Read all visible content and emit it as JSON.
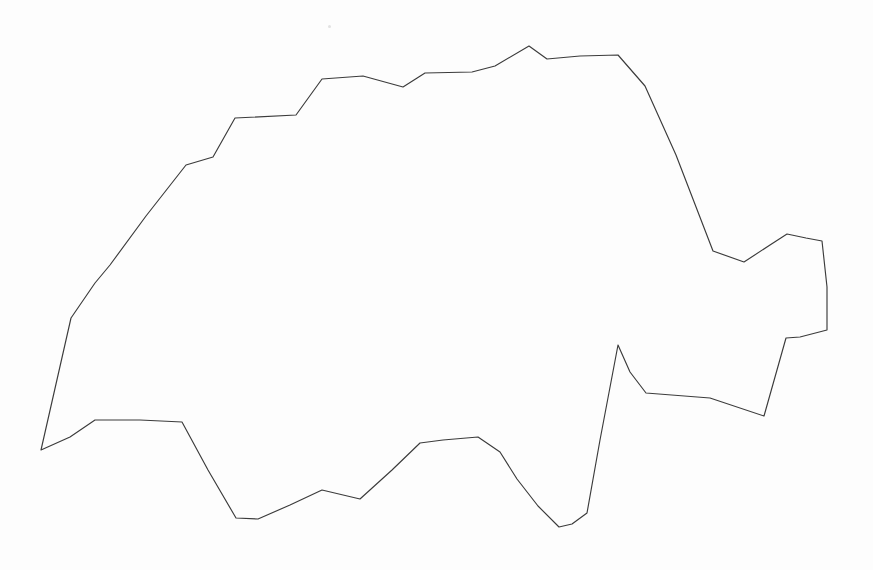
{
  "canvas": {
    "width": 873,
    "height": 570,
    "background_color": "#fdfdfd",
    "title": "Switzerland national border outline"
  },
  "map": {
    "subject": "Switzerland",
    "projection_note": "unprojected polygon outline, no labels",
    "outline_label": "country-border-outline",
    "stroke_color": "#3b3b3b",
    "stroke_width": 1.15,
    "fill_color": "none",
    "closed": true,
    "labels": [],
    "legend": [],
    "scale_bar": null,
    "north_arrow": null,
    "vertices": [
      [
        41,
        450
      ],
      [
        71,
        318
      ],
      [
        95,
        283
      ],
      [
        110,
        265
      ],
      [
        146,
        216
      ],
      [
        186,
        165
      ],
      [
        213,
        157
      ],
      [
        235,
        118
      ],
      [
        296,
        115
      ],
      [
        322,
        79
      ],
      [
        363,
        76
      ],
      [
        403,
        87
      ],
      [
        425,
        73
      ],
      [
        472,
        72
      ],
      [
        495,
        66
      ],
      [
        529,
        46
      ],
      [
        547,
        59
      ],
      [
        580,
        56
      ],
      [
        618,
        55
      ],
      [
        645,
        86
      ],
      [
        676,
        155
      ],
      [
        713,
        251
      ],
      [
        744,
        262
      ],
      [
        770,
        245
      ],
      [
        787,
        234
      ],
      [
        806,
        238
      ],
      [
        822,
        241
      ],
      [
        827,
        287
      ],
      [
        827,
        330
      ],
      [
        800,
        337
      ],
      [
        786,
        338
      ],
      [
        764,
        416
      ],
      [
        710,
        398
      ],
      [
        646,
        393
      ],
      [
        630,
        372
      ],
      [
        618,
        345
      ],
      [
        600,
        440
      ],
      [
        587,
        513
      ],
      [
        572,
        524
      ],
      [
        559,
        527
      ],
      [
        538,
        506
      ],
      [
        517,
        479
      ],
      [
        500,
        452
      ],
      [
        478,
        437
      ],
      [
        443,
        440
      ],
      [
        420,
        443
      ],
      [
        392,
        470
      ],
      [
        360,
        499
      ],
      [
        322,
        490
      ],
      [
        290,
        505
      ],
      [
        258,
        519
      ],
      [
        236,
        518
      ],
      [
        208,
        470
      ],
      [
        182,
        422
      ],
      [
        140,
        420
      ],
      [
        95,
        420
      ],
      [
        70,
        437
      ]
    ]
  },
  "artifacts": [
    {
      "name": "paper-speck",
      "x": 328,
      "y": 25,
      "color": "#e2e2e2"
    }
  ]
}
